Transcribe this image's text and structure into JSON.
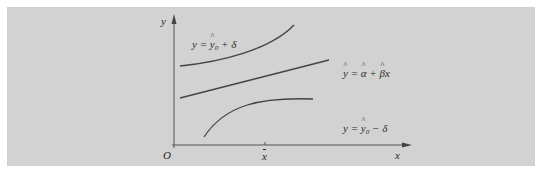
{
  "diagram": {
    "background_color": "#d2d2d2",
    "curve_color": "#444444",
    "axes": {
      "x_label": "x",
      "y_label": "y",
      "origin_label": "O",
      "x_tick_label": "x̄"
    },
    "curves": [
      {
        "id": "upper-band",
        "label": "y = ŷ₀ + δ",
        "label_parts": {
          "lhs": "y = ",
          "yhat": "y",
          "sub": "0",
          "rest": " + δ"
        }
      },
      {
        "id": "regression-line",
        "label": "ŷ = α̂ + β̂x",
        "label_parts": {
          "yhat": "y",
          "eq": " = ",
          "alpha": "α",
          "plus": " + ",
          "beta": "β",
          "x": "x"
        }
      },
      {
        "id": "lower-band",
        "label": "y = ŷ₀ − δ",
        "label_parts": {
          "lhs": "y = ",
          "yhat": "y",
          "sub": "0",
          "rest": " − δ"
        }
      }
    ]
  }
}
